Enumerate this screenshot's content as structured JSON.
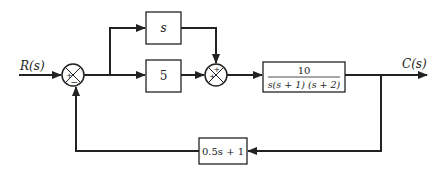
{
  "diagram": {
    "type": "block-diagram",
    "input": {
      "label": "R(s)"
    },
    "output": {
      "label": "C(s)"
    },
    "summing_junctions": [
      {
        "id": "sum1",
        "signs": {
          "left": "+",
          "bottom": "−"
        }
      },
      {
        "id": "sum2",
        "signs": {
          "left": "+",
          "top": "+"
        }
      }
    ],
    "blocks": [
      {
        "id": "derivative",
        "label": "s"
      },
      {
        "id": "proportional",
        "label": "5"
      },
      {
        "id": "plant",
        "numerator": "10",
        "denominator": "s(s + 1) (s + 2)"
      },
      {
        "id": "feedback",
        "label": "0.5s + 1"
      }
    ],
    "colors": {
      "line": "#222222",
      "background": "#ffffff"
    }
  }
}
